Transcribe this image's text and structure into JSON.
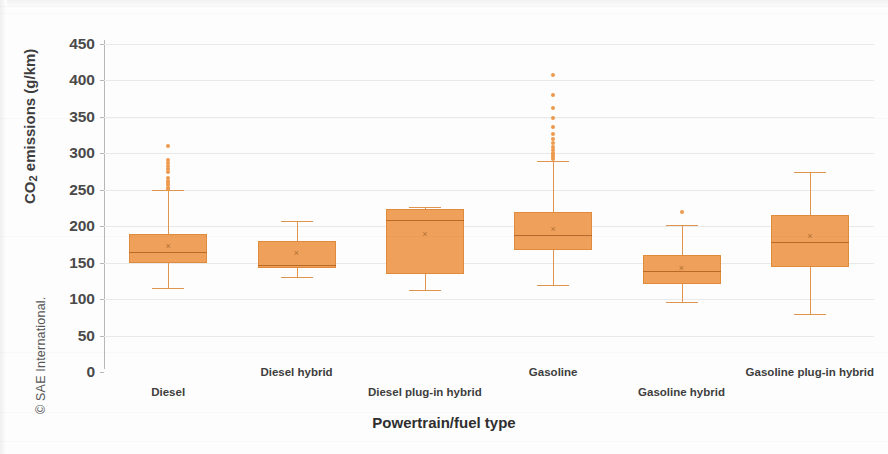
{
  "watermark": {
    "text": "© SAE International."
  },
  "chart_data": {
    "type": "box",
    "title": "",
    "xlabel": "Powertrain/fuel type",
    "ylabel_html": "CO2 emissions (g/km)",
    "ylabel_prefix": "CO",
    "ylabel_sub": "2",
    "ylabel_suffix": " emissions (g/km)",
    "ylim": [
      0,
      450
    ],
    "ytick_step": 50,
    "yticks": [
      0,
      50,
      100,
      150,
      200,
      250,
      300,
      350,
      400,
      450
    ],
    "grid": true,
    "legend": "none",
    "accent_color": "#EFA15C",
    "outlier_color": "#ED9A4E",
    "categories": [
      "Diesel",
      "Diesel hybrid",
      "Diesel plug-in hybrid",
      "Gasoline",
      "Gasoline hybrid",
      "Gasoline plug-in hybrid"
    ],
    "boxes": [
      {
        "category": "Diesel",
        "whisker_low": 115,
        "q1": 149,
        "median": 165,
        "mean": 173,
        "q3": 189,
        "whisker_high": 250,
        "outliers": [
          251,
          253,
          256,
          259,
          262,
          266,
          275,
          279,
          283,
          287,
          291,
          310
        ]
      },
      {
        "category": "Diesel hybrid",
        "whisker_low": 130,
        "q1": 142,
        "median": 147,
        "mean": 163,
        "q3": 180,
        "whisker_high": 207,
        "outliers": []
      },
      {
        "category": "Diesel plug-in hybrid",
        "whisker_low": 113,
        "q1": 135,
        "median": 208,
        "mean": 190,
        "q3": 224,
        "whisker_high": 227,
        "outliers": []
      },
      {
        "category": "Gasoline",
        "whisker_low": 120,
        "q1": 167,
        "median": 188,
        "mean": 196,
        "q3": 219,
        "whisker_high": 290,
        "outliers": [
          292,
          295,
          298,
          301,
          305,
          309,
          314,
          320,
          327,
          336,
          348,
          362,
          380,
          408
        ]
      },
      {
        "category": "Gasoline hybrid",
        "whisker_low": 96,
        "q1": 121,
        "median": 139,
        "mean": 143,
        "q3": 160,
        "whisker_high": 201,
        "outliers": [
          220
        ]
      },
      {
        "category": "Gasoline plug-in hybrid",
        "whisker_low": 80,
        "q1": 144,
        "median": 178,
        "mean": 186,
        "q3": 215,
        "whisker_high": 274,
        "outliers": []
      }
    ]
  }
}
